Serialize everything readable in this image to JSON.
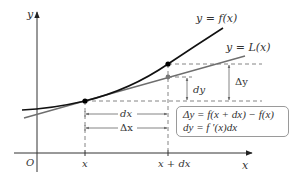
{
  "diagram": {
    "axes": {
      "y_label": "y",
      "x_label": "x",
      "origin_label": "O"
    },
    "curves": {
      "f_label": "y = f(x)",
      "L_label": "y = L(x)"
    },
    "tick_labels": {
      "x": "x",
      "x_plus_dx": "x + dx"
    },
    "measures": {
      "dx": "dx",
      "delta_x": "Δx",
      "dy": "dy",
      "delta_y": "Δy"
    },
    "formula_box": {
      "line1": "Δy = f(x + dx) − f(x)",
      "line2": "dy = f ′(x)dx"
    },
    "colors": {
      "f_curve": "#111111",
      "L_line": "#6e6e6e",
      "axes": "#333333",
      "dashes": "#555555",
      "box_border": "#9a9a9a"
    }
  }
}
